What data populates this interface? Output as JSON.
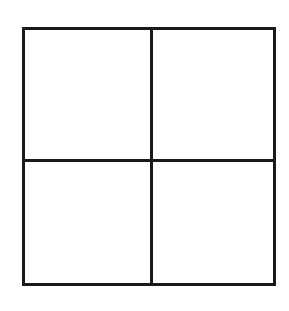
{
  "diagram": {
    "type": "grid",
    "rows": 2,
    "columns": 2,
    "line_color": "#1a1a1a",
    "background": "#ffffff",
    "cells": [
      {
        "row": 0,
        "col": 0,
        "label": ""
      },
      {
        "row": 0,
        "col": 1,
        "label": ""
      },
      {
        "row": 1,
        "col": 0,
        "label": ""
      },
      {
        "row": 1,
        "col": 1,
        "label": ""
      }
    ]
  }
}
